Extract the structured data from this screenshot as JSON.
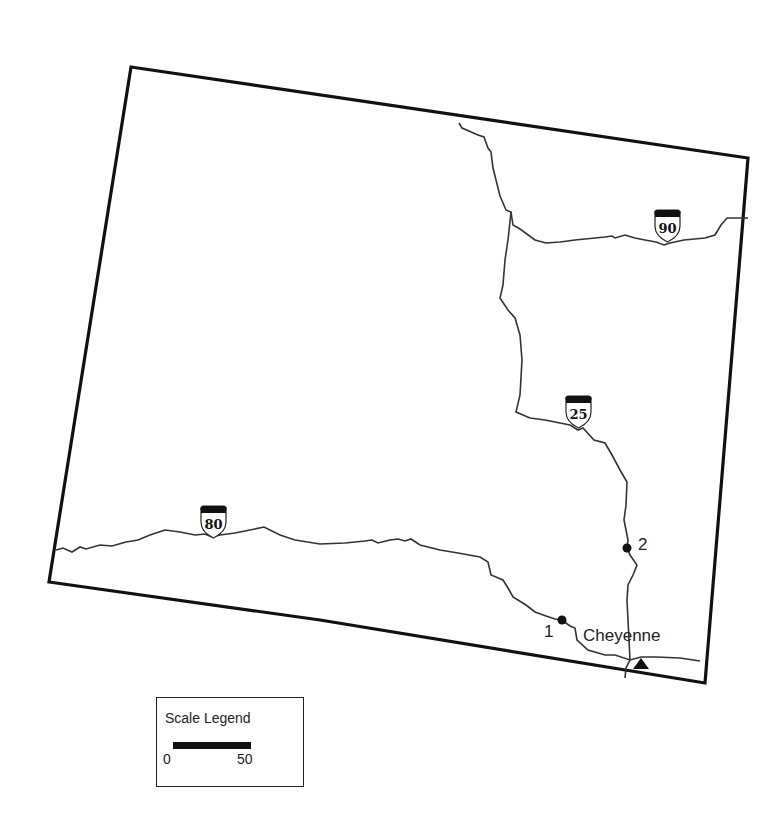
{
  "map": {
    "region": "Wyoming",
    "colors": {
      "border": "#111111",
      "road": "#333333",
      "background": "#ffffff"
    },
    "highways": [
      {
        "id": "I-90",
        "label": "90"
      },
      {
        "id": "I-25",
        "label": "25"
      },
      {
        "id": "I-80",
        "label": "80"
      }
    ],
    "points": [
      {
        "label": "1"
      },
      {
        "label": "2"
      }
    ],
    "city": {
      "name": "Cheyenne",
      "marker": "triangle-icon"
    }
  },
  "legend": {
    "title": "Scale Legend",
    "min": "0",
    "max": "50"
  }
}
